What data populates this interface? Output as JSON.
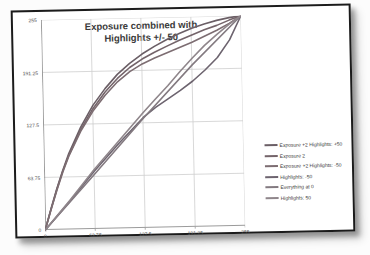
{
  "page": {
    "background": "#fcfcfc"
  },
  "frame": {
    "border_color": "#1b1b1b",
    "background": "#ffffff"
  },
  "colors": {
    "gridline": "#cfcfcf",
    "axis": "#9b9b9b",
    "tick_label": "#555555",
    "title": "#3b3b3b",
    "legend_text": "#3a3a3a"
  },
  "chart_data": {
    "type": "line",
    "title": "Exposure combined with Highlights +/- 50",
    "title_lines": [
      "Exposure combined with",
      "Highlights +/- 50"
    ],
    "xlabel": "",
    "ylabel": "",
    "xlim": [
      0,
      255
    ],
    "ylim": [
      0,
      255
    ],
    "x_ticks": [
      0,
      63.75,
      127.5,
      191.25,
      255
    ],
    "x_tick_labels": [
      "0",
      "63.75",
      "127.5",
      "191.25",
      "255"
    ],
    "y_ticks": [
      0,
      63.75,
      127.5,
      191.25,
      255
    ],
    "y_tick_labels": [
      "0",
      "63.75",
      "127.5",
      "191.25",
      "255"
    ],
    "grid": true,
    "legend_position": "right",
    "series": [
      {
        "name": "Exposure +2 Highlights: +50",
        "color": "#6b5f66",
        "points": [
          [
            0,
            0
          ],
          [
            8,
            26
          ],
          [
            16,
            50
          ],
          [
            24,
            72
          ],
          [
            32,
            92
          ],
          [
            48,
            124
          ],
          [
            64,
            150
          ],
          [
            80,
            170
          ],
          [
            96,
            187
          ],
          [
            112,
            200
          ],
          [
            128,
            211
          ],
          [
            144,
            220
          ],
          [
            160,
            228
          ],
          [
            176,
            235
          ],
          [
            192,
            241
          ],
          [
            208,
            246
          ],
          [
            224,
            250
          ],
          [
            240,
            253
          ],
          [
            255,
            255
          ]
        ]
      },
      {
        "name": "Exposure 2",
        "color": "#74646a",
        "points": [
          [
            0,
            0
          ],
          [
            8,
            25
          ],
          [
            16,
            49
          ],
          [
            24,
            71
          ],
          [
            32,
            90
          ],
          [
            48,
            121
          ],
          [
            64,
            146
          ],
          [
            80,
            166
          ],
          [
            96,
            182
          ],
          [
            112,
            195
          ],
          [
            128,
            205
          ],
          [
            144,
            213
          ],
          [
            160,
            220
          ],
          [
            176,
            227
          ],
          [
            192,
            233
          ],
          [
            208,
            239
          ],
          [
            224,
            244
          ],
          [
            240,
            250
          ],
          [
            255,
            255
          ]
        ]
      },
      {
        "name": "Exposure +2 Highlights: -50",
        "color": "#7d6d72",
        "points": [
          [
            0,
            0
          ],
          [
            8,
            25
          ],
          [
            16,
            48
          ],
          [
            24,
            70
          ],
          [
            32,
            89
          ],
          [
            48,
            119
          ],
          [
            64,
            143
          ],
          [
            80,
            162
          ],
          [
            96,
            178
          ],
          [
            112,
            190
          ],
          [
            128,
            199
          ],
          [
            144,
            206
          ],
          [
            160,
            212
          ],
          [
            176,
            218
          ],
          [
            192,
            224
          ],
          [
            208,
            231
          ],
          [
            224,
            238
          ],
          [
            240,
            246
          ],
          [
            255,
            255
          ]
        ]
      },
      {
        "name": "Highlights: -50",
        "color": "#6d646f",
        "points": [
          [
            0,
            0
          ],
          [
            32,
            34
          ],
          [
            64,
            70
          ],
          [
            96,
            103
          ],
          [
            128,
            134
          ],
          [
            144,
            146
          ],
          [
            160,
            156
          ],
          [
            176,
            166
          ],
          [
            192,
            177
          ],
          [
            208,
            190
          ],
          [
            224,
            205
          ],
          [
            240,
            226
          ],
          [
            255,
            255
          ]
        ]
      },
      {
        "name": "Everything at 0",
        "color": "#837a80",
        "points": [
          [
            0,
            0
          ],
          [
            64,
            66
          ],
          [
            128,
            133
          ],
          [
            192,
            197
          ],
          [
            255,
            255
          ]
        ]
      },
      {
        "name": "Highlights: 50",
        "color": "#8f868b",
        "points": [
          [
            0,
            0
          ],
          [
            32,
            35
          ],
          [
            64,
            72
          ],
          [
            96,
            106
          ],
          [
            128,
            140
          ],
          [
            144,
            156
          ],
          [
            160,
            172
          ],
          [
            176,
            189
          ],
          [
            192,
            205
          ],
          [
            208,
            220
          ],
          [
            224,
            233
          ],
          [
            240,
            245
          ],
          [
            255,
            255
          ]
        ]
      }
    ]
  }
}
